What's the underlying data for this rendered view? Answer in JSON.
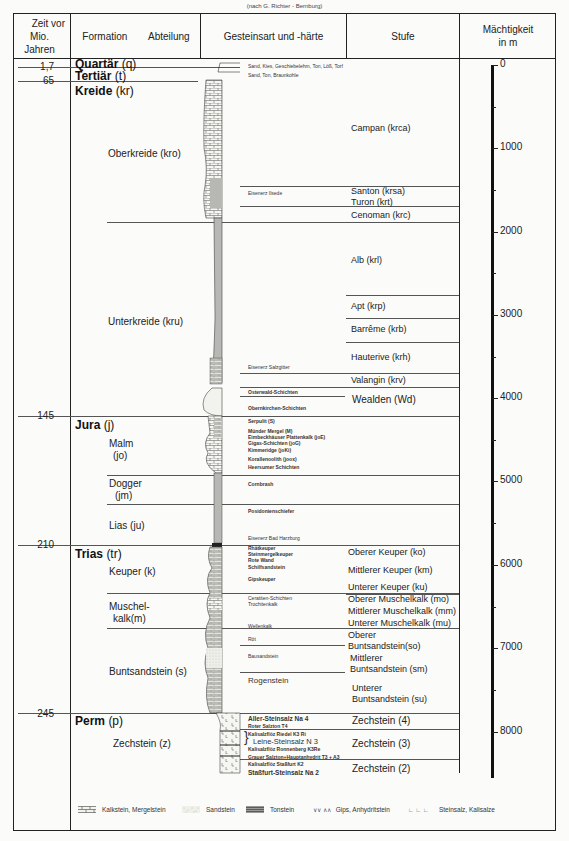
{
  "credit": "(nach G. Richter - Bernburg)",
  "header": {
    "time": [
      "Zeit vor",
      "Mio. Jahren"
    ],
    "formation": "Formation",
    "abteilung": "Abteilung",
    "gestein": "Gesteinsart und -härte",
    "stufe": "Stufe",
    "machtigkeit": [
      "Mächtigkeit",
      "in  m"
    ]
  },
  "ages": [
    {
      "label": "1,7",
      "y": 66
    },
    {
      "label": "65",
      "y": 80
    },
    {
      "label": "145",
      "y": 415
    },
    {
      "label": "210",
      "y": 544
    },
    {
      "label": "245",
      "y": 713
    }
  ],
  "formations": [
    {
      "name": "Quartär",
      "code": "(q)",
      "y": 60
    },
    {
      "name": "Tertiär",
      "code": "(t)",
      "y": 71
    },
    {
      "name": "Kreide",
      "code": "(kr)",
      "y": 86
    },
    {
      "name": "Jura",
      "code": "(j)",
      "y": 418
    },
    {
      "name": "Trias",
      "code": "(tr)",
      "y": 547
    },
    {
      "name": "Perm",
      "code": "(p)",
      "y": 714
    }
  ],
  "abteilungen": [
    {
      "lines": [
        "Oberkreide (kro)"
      ],
      "x": 108,
      "y": 148
    },
    {
      "lines": [
        "Unterkreide (kru)"
      ],
      "x": 108,
      "y": 316
    },
    {
      "lines": [
        "Malm",
        " (jo)"
      ],
      "x": 109,
      "y": 438
    },
    {
      "lines": [
        "Dogger",
        " (jm)"
      ],
      "x": 109,
      "y": 478
    },
    {
      "lines": [
        "Lias (ju)"
      ],
      "x": 109,
      "y": 520
    },
    {
      "lines": [
        "Keuper (k)"
      ],
      "x": 109,
      "y": 566
    },
    {
      "lines": [
        "Muschel-",
        " kalk(m)"
      ],
      "x": 109,
      "y": 601
    },
    {
      "lines": [
        "Buntsandstein (s)"
      ],
      "x": 109,
      "y": 666
    },
    {
      "lines": [
        "Zechstein (z)"
      ],
      "x": 113,
      "y": 738
    }
  ],
  "gestein_labels": [
    {
      "text": "Sand, Kies, Geschiebelehm, Ton, Löß, Torf",
      "x": 248,
      "y": 65,
      "style": ""
    },
    {
      "text": "Sand, Ton, Braunkohle",
      "x": 248,
      "y": 74,
      "style": ""
    },
    {
      "text": "Eisenerz  Ilsede",
      "x": 248,
      "y": 191,
      "style": ""
    },
    {
      "text": "Eisenerz  Salzgitter",
      "x": 248,
      "y": 364,
      "style": ""
    },
    {
      "text": "Osterwald-Schichten",
      "x": 248,
      "y": 389,
      "style": "bold"
    },
    {
      "text": "Obernkirchen-Schichten",
      "x": 248,
      "y": 405,
      "style": "bold"
    },
    {
      "text": "Serpulit (S)",
      "x": 248,
      "y": 418,
      "style": "bold"
    },
    {
      "text": "Münder Mergel (M)",
      "x": 248,
      "y": 428,
      "style": "bold"
    },
    {
      "text": "Eimbeckhäuser Plattenkalk (joE)",
      "x": 248,
      "y": 434,
      "style": "bold"
    },
    {
      "text": "Gigas-Schichten (joG)",
      "x": 248,
      "y": 440,
      "style": "bold"
    },
    {
      "text": "Kimmeridge (joKi)",
      "x": 248,
      "y": 447,
      "style": "bold"
    },
    {
      "text": "Korallenoolith (joox)",
      "x": 248,
      "y": 456,
      "style": "bold"
    },
    {
      "text": "Heersumer Schichten",
      "x": 248,
      "y": 464,
      "style": "bold"
    },
    {
      "text": "Cornbrash",
      "x": 248,
      "y": 482,
      "style": "bold"
    },
    {
      "text": "Posidonienschiefer",
      "x": 248,
      "y": 509,
      "style": "bold"
    },
    {
      "text": "Eisenerz  Bad Harzburg",
      "x": 248,
      "y": 535,
      "style": ""
    },
    {
      "text": "Rhätkeuper",
      "x": 248,
      "y": 545,
      "style": "bold"
    },
    {
      "text": "Steinmergelkeuper",
      "x": 248,
      "y": 551,
      "style": "bold"
    },
    {
      "text": "Rote Wand",
      "x": 248,
      "y": 557,
      "style": "bold"
    },
    {
      "text": "Schilfsandstein",
      "x": 248,
      "y": 564,
      "style": "bold"
    },
    {
      "text": "Gipskeuper",
      "x": 248,
      "y": 576,
      "style": "bold"
    },
    {
      "text": "Ceratiten-Schichten",
      "x": 248,
      "y": 595,
      "style": ""
    },
    {
      "text": "Trochitenkalk",
      "x": 248,
      "y": 601,
      "style": ""
    },
    {
      "text": "Wellenkalk",
      "x": 248,
      "y": 623,
      "style": ""
    },
    {
      "text": "Röt",
      "x": 248,
      "y": 636,
      "style": ""
    },
    {
      "text": "Bausandstein",
      "x": 248,
      "y": 654,
      "style": ""
    },
    {
      "text": "Rogenstein",
      "x": 248,
      "y": 679,
      "style": "big"
    },
    {
      "text": "Aller-Steinsalz Na 4",
      "x": 248,
      "y": 715,
      "style": "bold8"
    },
    {
      "text": "Roter Salzton T4",
      "x": 248,
      "y": 724,
      "style": "bold"
    },
    {
      "text": "Kalisalzflöz Riedel K3 Ri",
      "x": 248,
      "y": 731,
      "style": "bold"
    },
    {
      "text": "Leine-Steinsalz N 3",
      "x": 252,
      "y": 737,
      "style": "bold8"
    },
    {
      "text": "Kalisalzflöz Ronnenberg K3Re",
      "x": 248,
      "y": 746,
      "style": "bold"
    },
    {
      "text": "Grauer Salzton+Hauptanhydrit  T3 + A3",
      "x": 248,
      "y": 754,
      "style": "bold"
    },
    {
      "text": "Kalisalzflöz Staßfurt K2",
      "x": 248,
      "y": 761,
      "style": "bold"
    },
    {
      "text": "Staßfurt-Steinsalz Na 2",
      "x": 248,
      "y": 768,
      "style": "bold8"
    }
  ],
  "stufen": [
    {
      "lines": [
        "Campan (krca)"
      ],
      "x": 351,
      "y": 123
    },
    {
      "lines": [
        "Santon (krsa)",
        "Turon (krt)"
      ],
      "x": 351,
      "y": 186
    },
    {
      "lines": [
        "Cenoman (krc)"
      ],
      "x": 351,
      "y": 211
    },
    {
      "lines": [
        "Alb (krl)"
      ],
      "x": 351,
      "y": 255
    },
    {
      "lines": [
        "Apt (krp)"
      ],
      "x": 351,
      "y": 299
    },
    {
      "lines": [
        "Barrême (krb)"
      ],
      "x": 351,
      "y": 322
    },
    {
      "lines": [
        "Hauterive (krh)"
      ],
      "x": 351,
      "y": 352
    },
    {
      "lines": [
        "Valangin (krv)"
      ],
      "x": 351,
      "y": 375
    },
    {
      "lines": [
        "Wealden  (Wd)"
      ],
      "x": 352,
      "y": 395,
      "big": true
    },
    {
      "lines": [
        "Oberer Keuper (ko)"
      ],
      "x": 348,
      "y": 550
    },
    {
      "lines": [
        "Mittlerer Keuper (km)"
      ],
      "x": 348,
      "y": 566
    },
    {
      "lines": [
        "Unterer Keuper (ku)"
      ],
      "x": 348,
      "y": 584
    },
    {
      "lines": [
        "Oberer  Muschelkalk (mo)"
      ],
      "x": 348,
      "y": 595
    },
    {
      "lines": [
        "Mittlerer Muschelkalk (mm)"
      ],
      "x": 348,
      "y": 608
    },
    {
      "lines": [
        "Unterer  Muschelkalk (mu)"
      ],
      "x": 348,
      "y": 620
    },
    {
      "lines": [
        "Oberer",
        "Buntsandstein(so)"
      ],
      "x": 348,
      "y": 631
    },
    {
      "lines": [
        "Mittlerer",
        "Buntsandstein (sm)"
      ],
      "x": 350,
      "y": 656
    },
    {
      "lines": [
        "Unterer",
        "Buntsandstein (su)"
      ],
      "x": 352,
      "y": 683
    },
    {
      "lines": [
        "Zechstein (4)"
      ],
      "x": 352,
      "y": 715,
      "big": true
    },
    {
      "lines": [
        "Zechstein (3)"
      ],
      "x": 352,
      "y": 739,
      "big": true
    },
    {
      "lines": [
        "Zechstein (2)"
      ],
      "x": 352,
      "y": 764,
      "big": true
    }
  ],
  "depth_scale": {
    "unit": "m",
    "labels": [
      {
        "value": "0",
        "y": 65
      },
      {
        "value": "1000",
        "y": 148
      },
      {
        "value": "2000",
        "y": 232
      },
      {
        "value": "3000",
        "y": 315
      },
      {
        "value": "4000",
        "y": 398
      },
      {
        "value": "5000",
        "y": 481
      },
      {
        "value": "6000",
        "y": 565
      },
      {
        "value": "7000",
        "y": 648
      },
      {
        "value": "8000",
        "y": 732
      }
    ],
    "minor_ticks": [
      107,
      190,
      273,
      357,
      440,
      523,
      607,
      690
    ]
  },
  "legend": [
    {
      "label": "Kalkstein, Mergelstein",
      "pattern": "limestone"
    },
    {
      "label": "Sandstein",
      "pattern": "sand"
    },
    {
      "label": "Tonstein",
      "pattern": "clay"
    },
    {
      "label": "Gips, Anhydritstein",
      "pattern": "gypsum",
      "glyph": "∨∨ ∧∧"
    },
    {
      "label": "Steinsalz, Kalisalze",
      "pattern": "salt",
      "glyph": "∟ ∟ ∟"
    }
  ]
}
